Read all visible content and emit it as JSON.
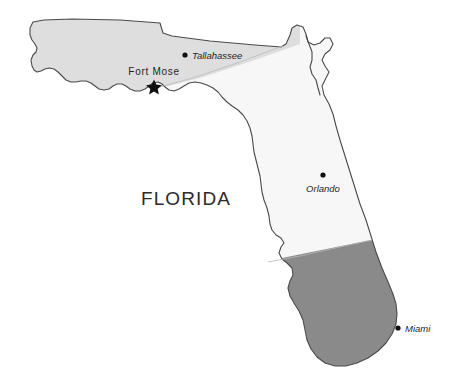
{
  "map": {
    "title": "FLORIDA",
    "background_color": "#ffffff",
    "outline_color": "#4a4a4a",
    "regions": [
      {
        "id": "panhandle",
        "name": "northwest-panhandle-region",
        "fill": "#dedede",
        "label": ""
      },
      {
        "id": "peninsula-north",
        "name": "central-peninsula-region",
        "fill": "#f7f7f7",
        "label": ""
      },
      {
        "id": "south",
        "name": "south-florida-region",
        "fill": "#8a8a8a",
        "label": ""
      }
    ],
    "markers": [
      {
        "name": "tallahassee",
        "label": "Tallahassee",
        "symbol": "dot",
        "dot_x": 185,
        "dot_y": 55,
        "label_x": 192,
        "label_y": 59,
        "anchor": "start"
      },
      {
        "name": "fort-mose",
        "label": "Fort Mose",
        "symbol": "star",
        "dot_x": 154,
        "dot_y": 86,
        "label_x": 154,
        "label_y": 75,
        "anchor": "middle"
      },
      {
        "name": "orlando",
        "label": "Orlando",
        "symbol": "dot",
        "dot_x": 323,
        "dot_y": 175,
        "label_x": 323,
        "label_y": 192,
        "anchor": "middle"
      },
      {
        "name": "miami",
        "label": "Miami",
        "symbol": "dot",
        "dot_x": 398,
        "dot_y": 328,
        "label_x": 405,
        "label_y": 332,
        "anchor": "start"
      }
    ],
    "title_position": {
      "x": 186,
      "y": 205
    },
    "colors": {
      "light_gray": "#dedede",
      "near_white": "#f7f7f7",
      "dark_gray": "#8a8a8a",
      "outline": "#4a4a4a",
      "text": "#1f1f1f"
    }
  }
}
